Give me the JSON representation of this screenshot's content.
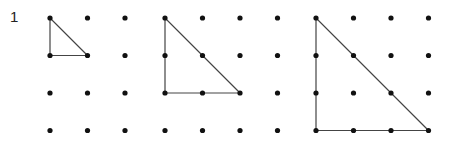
{
  "problem_number": "1",
  "colors": {
    "dot": "#111111",
    "line": "#444444"
  },
  "dot_spacing": 37.5,
  "grids": [
    {
      "id": "grid-1",
      "origin": [
        50,
        18
      ],
      "cols": 3,
      "rows": 4,
      "triangle": {
        "vertices": [
          [
            0,
            0
          ],
          [
            0,
            1
          ],
          [
            1,
            1
          ]
        ],
        "leg": 1
      }
    },
    {
      "id": "grid-2",
      "origin": [
        165,
        18
      ],
      "cols": 4,
      "rows": 4,
      "triangle": {
        "vertices": [
          [
            0,
            0
          ],
          [
            0,
            2
          ],
          [
            2,
            2
          ]
        ],
        "leg": 2
      }
    },
    {
      "id": "grid-3",
      "origin": [
        316,
        18
      ],
      "cols": 4,
      "rows": 4,
      "triangle": {
        "vertices": [
          [
            0,
            0
          ],
          [
            0,
            3
          ],
          [
            3,
            3
          ]
        ],
        "leg": 3
      }
    }
  ]
}
